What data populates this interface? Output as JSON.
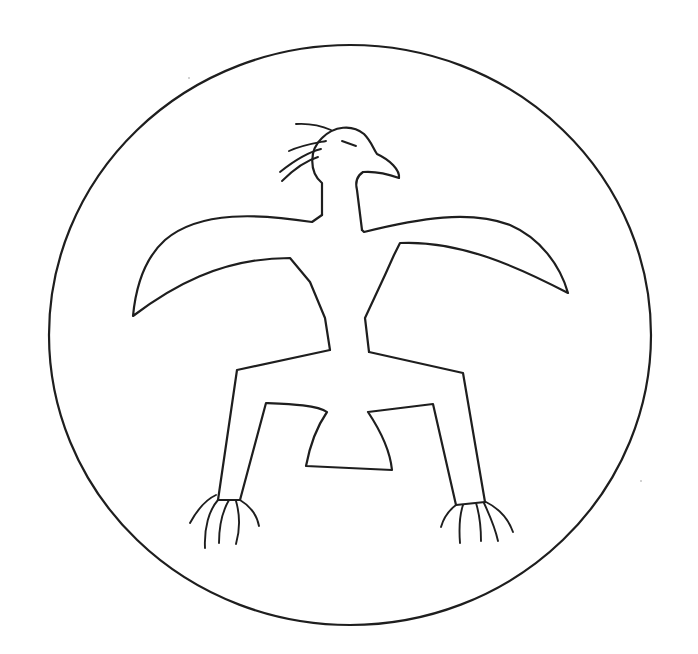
{
  "figure": {
    "subject": "Thunderbird line drawing in a circle",
    "stroke_color": "#1e1e1e",
    "background_color": "#ffffff",
    "parts": [
      "circle-frame",
      "head",
      "crest",
      "eye",
      "beak",
      "left-wing",
      "right-wing",
      "body",
      "left-leg",
      "right-leg",
      "left-talons",
      "right-talons"
    ]
  }
}
